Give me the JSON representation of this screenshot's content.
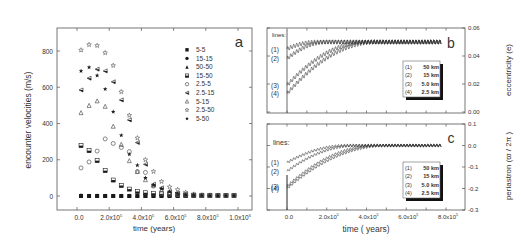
{
  "chart_data": [
    {
      "panel": "a",
      "type": "scatter",
      "panel_label": "a",
      "xlabel": "time (years)",
      "ylabel": "encounter  velocities  (m/s)",
      "xlim": [
        -100000.0,
        1050000.0
      ],
      "ylim": [
        -75,
        920
      ],
      "xticks": [
        0,
        200000,
        400000,
        600000,
        800000,
        1000000
      ],
      "xtick_labels": [
        "0.0",
        "2.0x10^5",
        "4.0x10^5",
        "6.0x10^5",
        "8.0x10^5",
        "1.0x10^6"
      ],
      "yticks": [
        0,
        200,
        400,
        600,
        800
      ],
      "ytick_labels": [
        "0",
        "200",
        "400",
        "600",
        "800"
      ],
      "grid": false,
      "legend_position": "upper right",
      "x": [
        25000,
        75000,
        125000,
        175000,
        225000,
        275000,
        325000,
        375000,
        425000,
        475000,
        525000,
        575000,
        625000,
        675000,
        725000,
        775000,
        825000,
        875000,
        925000,
        975000
      ],
      "series": [
        {
          "name": "5-5",
          "marker": "square-filled",
          "values": [
            0,
            0,
            0,
            0,
            0,
            0,
            0,
            0,
            0,
            0,
            0,
            0,
            0,
            0,
            0,
            0,
            0,
            0,
            0,
            0
          ]
        },
        {
          "name": "15-15",
          "marker": "circle-filled",
          "values": [
            0,
            0,
            0,
            0,
            0,
            0,
            0,
            0,
            0,
            0,
            0,
            0,
            0,
            0,
            0,
            0,
            0,
            0,
            0,
            0
          ]
        },
        {
          "name": "50-50",
          "marker": "triangle-filled",
          "values": [
            5,
            3,
            4,
            3,
            3,
            3,
            3,
            3,
            3,
            3,
            3,
            3,
            3,
            3,
            3,
            3,
            3,
            3,
            3,
            3
          ]
        },
        {
          "name": "15-50",
          "marker": "square-half",
          "values": [
            278,
            250,
            195,
            140,
            88,
            58,
            38,
            25,
            18,
            15,
            12,
            10,
            8,
            6,
            5,
            4,
            4,
            3,
            3,
            3
          ]
        },
        {
          "name": "2.5-5",
          "marker": "circle-open",
          "values": [
            155,
            188,
            248,
            315,
            290,
            268,
            245,
            135,
            130,
            55,
            15,
            10,
            8,
            5,
            4,
            3,
            3,
            3,
            3,
            3
          ]
        },
        {
          "name": "2.5-15",
          "marker": "triangle-left-half",
          "values": [
            585,
            650,
            700,
            690,
            630,
            530,
            420,
            295,
            175,
            65,
            45,
            25,
            15,
            8,
            5,
            4,
            3,
            3,
            3,
            3
          ]
        },
        {
          "name": "5-15",
          "marker": "triangle-open",
          "values": [
            460,
            500,
            525,
            495,
            385,
            285,
            195,
            135,
            90,
            60,
            35,
            20,
            10,
            5,
            4,
            3,
            3,
            3,
            3,
            3
          ]
        },
        {
          "name": "2.5-50",
          "marker": "star-open",
          "values": [
            805,
            835,
            830,
            790,
            720,
            575,
            445,
            320,
            200,
            135,
            80,
            50,
            35,
            20,
            10,
            5,
            4,
            3,
            3,
            3
          ]
        },
        {
          "name": "5-50",
          "marker": "star-filled",
          "values": [
            690,
            710,
            665,
            590,
            465,
            335,
            230,
            170,
            100,
            60,
            40,
            25,
            15,
            8,
            5,
            4,
            3,
            3,
            3,
            3
          ]
        }
      ]
    },
    {
      "panel": "b",
      "type": "line",
      "panel_label": "b",
      "annotation": "lines:",
      "xlabel": "",
      "ylabel": "eccentricity (e)",
      "y_axis_side": "right",
      "xlim": [
        -100000.0,
        860000.0
      ],
      "ylim": [
        0.0,
        0.06
      ],
      "yticks": [
        0.0,
        0.02,
        0.04,
        0.06
      ],
      "ytick_labels": [
        "0.00",
        "0.02",
        "0.04",
        "0.06"
      ],
      "grid": false,
      "legend_position": "center right",
      "line_labels": [
        "(1)",
        "(2)",
        "(3)",
        "(4)"
      ],
      "series": [
        {
          "name": "(1)  50 km",
          "start": 0.045,
          "end": 0.05,
          "settle_time": 150000.0,
          "oscillation": 0.0015
        },
        {
          "name": "(2)  15 km",
          "start": 0.038,
          "end": 0.05,
          "settle_time": 200000.0,
          "oscillation": 0.0015
        },
        {
          "name": "(3)  5.0 km",
          "start": 0.019,
          "end": 0.05,
          "settle_time": 400000.0,
          "oscillation": 0.0015
        },
        {
          "name": "(4)  2.5 km",
          "start": 0.013,
          "end": 0.05,
          "settle_time": 450000.0,
          "oscillation": 0.0015
        }
      ]
    },
    {
      "panel": "c",
      "type": "line",
      "panel_label": "c",
      "annotation": "lines:",
      "xlabel": "time ( years)",
      "ylabel": "periastron (ϖ / 2π )",
      "y_axis_side": "right",
      "xlim": [
        -100000.0,
        860000.0
      ],
      "ylim": [
        -0.3,
        0.1
      ],
      "xticks": [
        0,
        200000,
        400000,
        600000,
        800000
      ],
      "xtick_labels": [
        "0.0",
        "2.0x10^5",
        "4.0x10^5",
        "6.0x10^5",
        "8.0x10^5"
      ],
      "yticks": [
        -0.3,
        -0.2,
        -0.1,
        0.0,
        0.1
      ],
      "ytick_labels": [
        "-0.3",
        "-0.2",
        "-0.1",
        "0.0",
        "0.1"
      ],
      "grid": false,
      "legend_position": "center right",
      "line_labels": [
        "(1)",
        "(2)",
        "(3)",
        "(4)"
      ],
      "series": [
        {
          "name": "(1)  50 km",
          "start": -0.08,
          "end": 0.0,
          "settle_time": 300000.0,
          "oscillation": 0.006
        },
        {
          "name": "(2)  15 km",
          "start": -0.12,
          "end": 0.0,
          "settle_time": 350000.0,
          "oscillation": 0.006
        },
        {
          "name": "(3)  5.0 km",
          "start": -0.19,
          "end": 0.0,
          "settle_time": 450000.0,
          "oscillation": 0.006
        },
        {
          "name": "(4)  2.5 km",
          "start": -0.2,
          "end": 0.0,
          "settle_time": 500000.0,
          "oscillation": 0.006
        }
      ]
    }
  ],
  "labels": {
    "panel_a": "a",
    "panel_b": "b",
    "panel_c": "c",
    "lines_b": "lines:",
    "lines_c": "lines:",
    "xlabel_a": "time (years)",
    "xlabel_bc": "time ( years)",
    "ylabel_a": "encounter  velocities  (m/s)",
    "ylabel_b": "eccentricity (e)",
    "ylabel_c": "periastron (ϖ / 2π )"
  },
  "colors": {
    "axis": "#555555",
    "marker": "#1a1a1a",
    "marker_open": "#555555",
    "line": "#333333"
  }
}
